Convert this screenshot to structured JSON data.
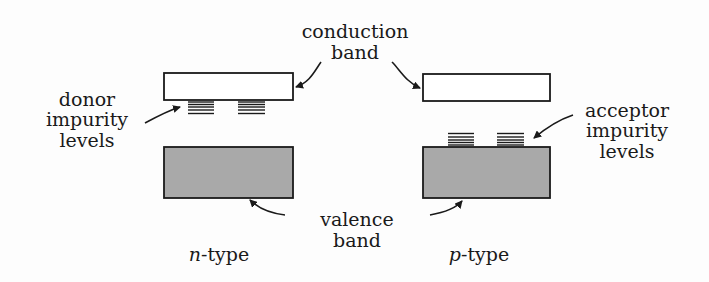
{
  "diagram": {
    "colors": {
      "outline": "#1a1a1a",
      "valence_fill": "#a9a9a9",
      "background": "#fdfdfd"
    },
    "labels": {
      "conduction_line1": "conduction",
      "conduction_line2": "band",
      "donor_line1": "donor",
      "donor_line2": "impurity",
      "donor_line3": "levels",
      "acceptor_line1": "acceptor",
      "acceptor_line2": "impurity",
      "acceptor_line3": "levels",
      "valence_line1": "valence",
      "valence_line2": "band",
      "n_type_letter": "n",
      "n_type_suffix": "-type",
      "p_type_letter": "p",
      "p_type_suffix": "-type"
    },
    "panels": [
      {
        "name": "n-type",
        "has": [
          "conduction band",
          "donor impurity levels",
          "valence band"
        ]
      },
      {
        "name": "p-type",
        "has": [
          "conduction band",
          "acceptor impurity levels",
          "valence band"
        ]
      }
    ]
  }
}
